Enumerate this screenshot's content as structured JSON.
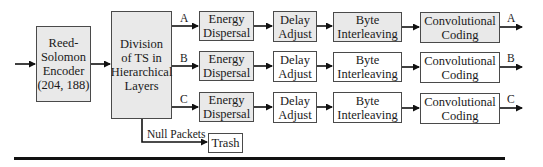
{
  "diagram": {
    "reed_solomon": {
      "label": "Reed-\nSolomon\nEncoder\n(204, 188)",
      "fill": "#e9e9e9"
    },
    "division": {
      "label": "Division\nof TS in\nHierarchical\nLayers",
      "fill": "#e9e9e9"
    },
    "rows": [
      {
        "layer": "A",
        "energy": "Energy\nDispersal",
        "delay": "Delay\nAdjust",
        "byte": "Byte\nInterleaving",
        "conv": "Convolutional\nCoding"
      },
      {
        "layer": "B",
        "energy": "Energy\nDispersal",
        "delay": "Delay\nAdjust",
        "byte": "Byte\nInterleaving",
        "conv": "Convolutional\nCoding"
      },
      {
        "layer": "C",
        "energy": "Energy\nDispersal",
        "delay": "Delay\nAdjust",
        "byte": "Byte\nInterleaving",
        "conv": "Convolutional\nCoding"
      }
    ],
    "null_packets_label": "Null Packets",
    "trash": "Trash",
    "colors": {
      "gray_fill": "#e9e9e9",
      "stroke": "#4a4a4a",
      "arrow": "#111111"
    }
  }
}
